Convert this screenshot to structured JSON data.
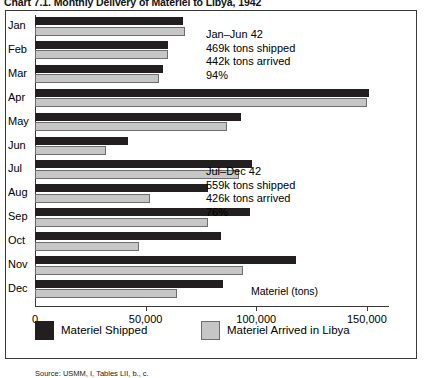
{
  "chart_title": "Chart 7.1.  Monthly Delivery of Materiel to Libya, 1942",
  "source_note": "Source: USMM, I, Tables LII, b., c.",
  "axis_caption": "Materiel (tons)",
  "legend": {
    "items": [
      {
        "label": "Materiel Shipped",
        "swatch": "shipped",
        "color": "#231f20"
      },
      {
        "label": "Materiel Arrived in Libya",
        "swatch": "arrived",
        "color": "#c6c6c6"
      }
    ]
  },
  "annotations": [
    {
      "lines": [
        "Jan–Jun 42",
        "469k tons shipped",
        "442k tons arrived",
        "94%"
      ]
    },
    {
      "lines": [
        "Jul–Dec 42",
        "559k tons shipped",
        "426k tons arrived",
        "76%"
      ]
    }
  ],
  "chart_data": {
    "type": "bar",
    "orientation": "horizontal",
    "title": "Chart 7.1.  Monthly Delivery of Materiel to Libya, 1942",
    "xlabel": "Materiel (tons)",
    "ylabel": "",
    "xlim": [
      0,
      160000
    ],
    "xticks": [
      0,
      50000,
      100000,
      150000
    ],
    "xticklabels": [
      "0",
      "50,000",
      "100,000",
      "150,000"
    ],
    "grid": false,
    "legend_position": "bottom",
    "categories": [
      "Jan",
      "Feb",
      "Mar",
      "Apr",
      "May",
      "Jun",
      "Jul",
      "Aug",
      "Sep",
      "Oct",
      "Nov",
      "Dec"
    ],
    "series": [
      {
        "name": "Materiel Shipped",
        "color": "#231f20",
        "values": [
          67000,
          60000,
          58000,
          151000,
          93000,
          42000,
          98000,
          78000,
          97000,
          84000,
          118000,
          85000
        ]
      },
      {
        "name": "Materiel Arrived in Libya",
        "color": "#c6c6c6",
        "values": [
          68000,
          60000,
          56000,
          150000,
          87000,
          32000,
          92000,
          52000,
          78000,
          47000,
          94000,
          64000
        ]
      }
    ],
    "annotations": [
      {
        "text": "Jan–Jun 42 / 469k tons shipped / 442k tons arrived / 94%",
        "period": "Jan–Jun 42",
        "shipped_k": 469,
        "arrived_k": 442,
        "pct": 94
      },
      {
        "text": "Jul–Dec 42 / 559k tons shipped / 426k tons arrived / 76%",
        "period": "Jul–Dec 42",
        "shipped_k": 559,
        "arrived_k": 426,
        "pct": 76
      }
    ],
    "source": "Source: USMM, I, Tables LII, b., c."
  }
}
